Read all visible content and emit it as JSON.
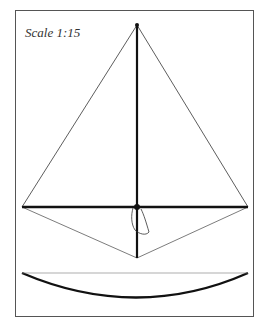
{
  "diagram": {
    "scale_label": "Scale 1:15",
    "colors": {
      "line": "#222222",
      "frame": "#555555",
      "background": "#ffffff"
    },
    "points": {
      "top": [
        137,
        25
      ],
      "left": [
        22,
        207
      ],
      "right": [
        248,
        207
      ],
      "bottom": [
        137,
        258
      ],
      "center": [
        137,
        207
      ]
    },
    "bow": {
      "start": [
        22,
        273
      ],
      "control": [
        137,
        322
      ],
      "end": [
        248,
        273
      ]
    }
  }
}
